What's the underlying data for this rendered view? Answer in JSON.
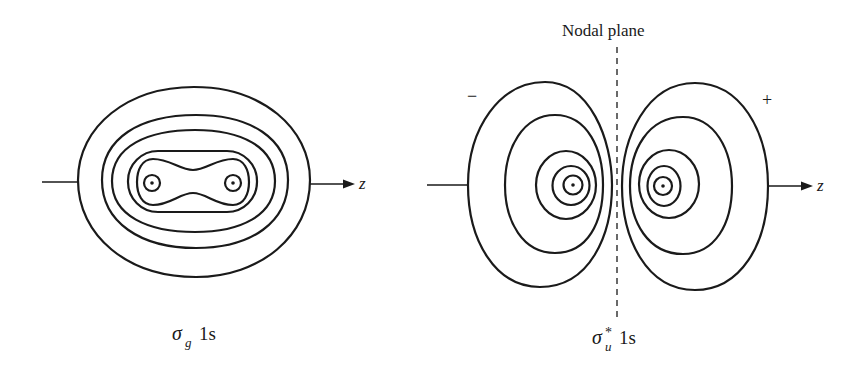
{
  "diagram": {
    "left_panel": {
      "caption": {
        "symbol": "σ",
        "subscript": "g",
        "orbital": "1s"
      },
      "axis_label": "z",
      "contour_count": 5,
      "nuclei": 2
    },
    "right_panel": {
      "title": "Nodal plane",
      "caption": {
        "symbol": "σ",
        "superscript": "*",
        "subscript": "u",
        "orbital": "1s"
      },
      "axis_label": "z",
      "sign_left": "−",
      "sign_right": "+",
      "contours_per_lobe": 5,
      "nuclei": 2
    }
  }
}
